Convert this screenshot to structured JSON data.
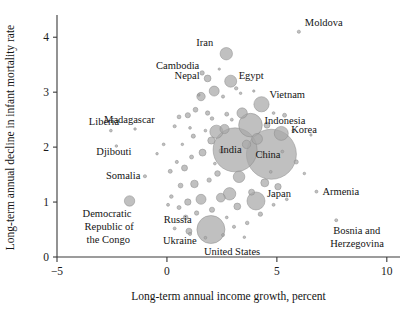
{
  "chart_data": {
    "type": "scatter",
    "title": "",
    "xlabel": "Long-term annual income growth, percent",
    "ylabel": "Long-term annual decline in infant mortality rate",
    "xlim": [
      -5,
      10.6
    ],
    "ylim": [
      0,
      4.35
    ],
    "xticks": [
      -5,
      0,
      5,
      10
    ],
    "xtick_labels": [
      "−5",
      "0",
      "5",
      "10"
    ],
    "yticks": [
      0,
      1,
      2,
      3,
      4
    ],
    "ytick_labels": [
      "0",
      "1",
      "2",
      "3",
      "4"
    ],
    "grid": false,
    "legend": "none",
    "bubble_color": "#a8a8a8",
    "bubble_opacity": 0.72,
    "size_meaning": "population",
    "labeled_points": [
      {
        "name": "Iran",
        "x": 2.7,
        "y": 3.7,
        "r": 6.2,
        "label_dx": -30,
        "label_dy": -8
      },
      {
        "name": "Moldova",
        "x": 6.0,
        "y": 4.1,
        "r": 1.6,
        "label_dx": 6,
        "label_dy": -6
      },
      {
        "name": "Cambodia",
        "x": 1.6,
        "y": 3.35,
        "r": 2.2,
        "label_dx": -46,
        "label_dy": -4
      },
      {
        "name": "Nepal",
        "x": 1.85,
        "y": 3.25,
        "r": 3.4,
        "label_dx": -33,
        "label_dy": 1
      },
      {
        "name": "Egypt",
        "x": 2.9,
        "y": 3.2,
        "r": 6.0,
        "label_dx": 8,
        "label_dy": -2
      },
      {
        "name": "Vietnam",
        "x": 4.3,
        "y": 2.78,
        "r": 7.6,
        "label_dx": 8,
        "label_dy": -6
      },
      {
        "name": "Indonesia",
        "x": 3.8,
        "y": 2.4,
        "r": 11.8,
        "label_dx": 14,
        "label_dy": -1
      },
      {
        "name": "Korea",
        "x": 5.2,
        "y": 2.25,
        "r": 7.0,
        "label_dx": 10,
        "label_dy": 0
      },
      {
        "name": "India",
        "x": 3.1,
        "y": 1.95,
        "r": 22.0,
        "label_dx": -15,
        "label_dy": 3
      },
      {
        "name": "China",
        "x": 4.75,
        "y": 1.87,
        "r": 25.0,
        "label_dx": -16,
        "label_dy": 4
      },
      {
        "name": "Japan",
        "x": 4.05,
        "y": 1.02,
        "r": 9.0,
        "label_dx": 11,
        "label_dy": -4
      },
      {
        "name": "Armenia",
        "x": 6.8,
        "y": 1.19,
        "r": 1.5,
        "label_dx": 6,
        "label_dy": 3
      },
      {
        "name": "Bosnia and",
        "x": 7.7,
        "y": 0.67,
        "r": 1.5,
        "label_dx": -3,
        "label_dy": 14
      },
      {
        "name": "Herzegovina",
        "x": 7.7,
        "y": 0.67,
        "r": 0,
        "label_dx": -6,
        "label_dy": 27
      },
      {
        "name": "United States",
        "x": 2.0,
        "y": 0.5,
        "r": 14.0,
        "label_dx": -7,
        "label_dy": 25
      },
      {
        "name": "Ukraine",
        "x": 1.0,
        "y": 0.47,
        "r": 3.0,
        "label_dx": -26,
        "label_dy": 13
      },
      {
        "name": "Russia",
        "x": 0.85,
        "y": 0.72,
        "r": 2.4,
        "label_dx": -22,
        "label_dy": 6
      },
      {
        "name": "Liberia",
        "x": -2.55,
        "y": 2.3,
        "r": 1.4,
        "label_dx": -22,
        "label_dy": -6
      },
      {
        "name": "Madagascar",
        "x": -1.45,
        "y": 2.33,
        "r": 1.3,
        "label_dx": -31,
        "label_dy": -6
      },
      {
        "name": "Djibouti",
        "x": -2.3,
        "y": 2.02,
        "r": 1.3,
        "label_dx": -20,
        "label_dy": 9
      },
      {
        "name": "Somalia",
        "x": -1.0,
        "y": 1.47,
        "r": 1.6,
        "label_dx": -39,
        "label_dy": 3
      },
      {
        "name": "Democratic",
        "x": -1.7,
        "y": 1.02,
        "r": 5.2,
        "label_dx": -47,
        "label_dy": 16
      },
      {
        "name": "Republic of",
        "x": -1.7,
        "y": 1.02,
        "r": 0,
        "label_dx": -45,
        "label_dy": 29
      },
      {
        "name": "the Congo",
        "x": -1.7,
        "y": 1.02,
        "r": 0,
        "label_dx": -43,
        "label_dy": 42
      }
    ],
    "unlabeled_points": [
      {
        "x": 2.15,
        "y": 3.02,
        "r": 5.0
      },
      {
        "x": 1.55,
        "y": 2.92,
        "r": 4.2
      },
      {
        "x": 1.3,
        "y": 2.68,
        "r": 2.4
      },
      {
        "x": 1.85,
        "y": 2.62,
        "r": 2.2
      },
      {
        "x": 2.05,
        "y": 2.52,
        "r": 1.8
      },
      {
        "x": 2.55,
        "y": 2.92,
        "r": 1.6
      },
      {
        "x": 0.55,
        "y": 2.55,
        "r": 1.9
      },
      {
        "x": 0.95,
        "y": 2.58,
        "r": 2.6
      },
      {
        "x": 3.15,
        "y": 3.07,
        "r": 1.7
      },
      {
        "x": 3.35,
        "y": 2.98,
        "r": 1.3
      },
      {
        "x": 2.72,
        "y": 2.6,
        "r": 2.0
      },
      {
        "x": 3.42,
        "y": 2.62,
        "r": 5.2
      },
      {
        "x": 2.95,
        "y": 2.5,
        "r": 1.5
      },
      {
        "x": 1.05,
        "y": 2.35,
        "r": 1.4
      },
      {
        "x": 0.35,
        "y": 2.38,
        "r": 1.6
      },
      {
        "x": 1.75,
        "y": 2.3,
        "r": 1.4
      },
      {
        "x": 1.2,
        "y": 2.2,
        "r": 2.1
      },
      {
        "x": 2.25,
        "y": 2.28,
        "r": 6.6
      },
      {
        "x": 2.62,
        "y": 2.33,
        "r": 4.6
      },
      {
        "x": 2.02,
        "y": 2.12,
        "r": 3.6
      },
      {
        "x": 4.55,
        "y": 2.4,
        "r": 3.0
      },
      {
        "x": 5.35,
        "y": 2.58,
        "r": 2.0
      },
      {
        "x": 5.75,
        "y": 2.3,
        "r": 1.5
      },
      {
        "x": 4.1,
        "y": 2.15,
        "r": 5.4
      },
      {
        "x": 4.85,
        "y": 2.62,
        "r": 1.4
      },
      {
        "x": 3.62,
        "y": 2.05,
        "r": 4.2
      },
      {
        "x": 2.48,
        "y": 1.93,
        "r": 2.4
      },
      {
        "x": 1.62,
        "y": 1.9,
        "r": 3.5
      },
      {
        "x": 1.12,
        "y": 1.82,
        "r": 2.0
      },
      {
        "x": 0.45,
        "y": 1.73,
        "r": 1.6
      },
      {
        "x": 0.15,
        "y": 1.56,
        "r": 2.0
      },
      {
        "x": 0.8,
        "y": 1.62,
        "r": 3.0
      },
      {
        "x": 2.3,
        "y": 1.52,
        "r": 2.8
      },
      {
        "x": 1.92,
        "y": 1.4,
        "r": 2.2
      },
      {
        "x": 1.25,
        "y": 1.33,
        "r": 3.8
      },
      {
        "x": 0.62,
        "y": 1.3,
        "r": 2.4
      },
      {
        "x": 3.28,
        "y": 1.46,
        "r": 5.8
      },
      {
        "x": 5.88,
        "y": 1.73,
        "r": 2.1
      },
      {
        "x": 6.25,
        "y": 1.52,
        "r": 1.3
      },
      {
        "x": 4.45,
        "y": 1.35,
        "r": 4.0
      },
      {
        "x": 5.05,
        "y": 1.28,
        "r": 3.2
      },
      {
        "x": 3.85,
        "y": 1.18,
        "r": 3.0
      },
      {
        "x": 2.85,
        "y": 1.15,
        "r": 6.2
      },
      {
        "x": 2.45,
        "y": 1.08,
        "r": 4.4
      },
      {
        "x": 1.55,
        "y": 1.05,
        "r": 5.0
      },
      {
        "x": 0.95,
        "y": 1.0,
        "r": 3.2
      },
      {
        "x": 0.2,
        "y": 1.1,
        "r": 1.8
      },
      {
        "x": 3.2,
        "y": 0.92,
        "r": 3.4
      },
      {
        "x": 2.05,
        "y": 0.86,
        "r": 2.6
      },
      {
        "x": 1.35,
        "y": 0.8,
        "r": 2.2
      },
      {
        "x": 0.55,
        "y": 0.9,
        "r": 2.0
      },
      {
        "x": 4.25,
        "y": 0.78,
        "r": 2.2
      },
      {
        "x": 3.65,
        "y": 0.62,
        "r": 1.8
      },
      {
        "x": 3.05,
        "y": 0.55,
        "r": 1.6
      },
      {
        "x": 2.55,
        "y": 0.4,
        "r": 1.5
      },
      {
        "x": 1.75,
        "y": 0.35,
        "r": 1.4
      },
      {
        "x": 1.05,
        "y": 0.42,
        "r": 1.6
      },
      {
        "x": 0.35,
        "y": 0.52,
        "r": 1.5
      },
      {
        "x": 4.85,
        "y": 0.95,
        "r": 1.5
      },
      {
        "x": 5.45,
        "y": 1.05,
        "r": 1.4
      },
      {
        "x": 4.35,
        "y": 1.88,
        "r": 1.5
      },
      {
        "x": 4.72,
        "y": 1.55,
        "r": 1.4
      },
      {
        "x": -0.15,
        "y": 2.05,
        "r": 1.4
      },
      {
        "x": -0.45,
        "y": 1.88,
        "r": 1.3
      },
      {
        "x": 0.05,
        "y": 0.95,
        "r": 1.5
      },
      {
        "x": 6.55,
        "y": 2.22,
        "r": 1.2
      },
      {
        "x": 3.95,
        "y": 3.02,
        "r": 1.2
      },
      {
        "x": 2.38,
        "y": 3.42,
        "r": 1.2
      },
      {
        "x": 5.25,
        "y": 1.92,
        "r": 1.4
      },
      {
        "x": 2.72,
        "y": 0.72,
        "r": 1.4
      },
      {
        "x": 3.52,
        "y": 0.36,
        "r": 1.3
      },
      {
        "x": 1.45,
        "y": 2.95,
        "r": 1.3
      },
      {
        "x": 0.7,
        "y": 2.05,
        "r": 1.3
      },
      {
        "x": 2.18,
        "y": 1.7,
        "r": 1.4
      }
    ]
  }
}
